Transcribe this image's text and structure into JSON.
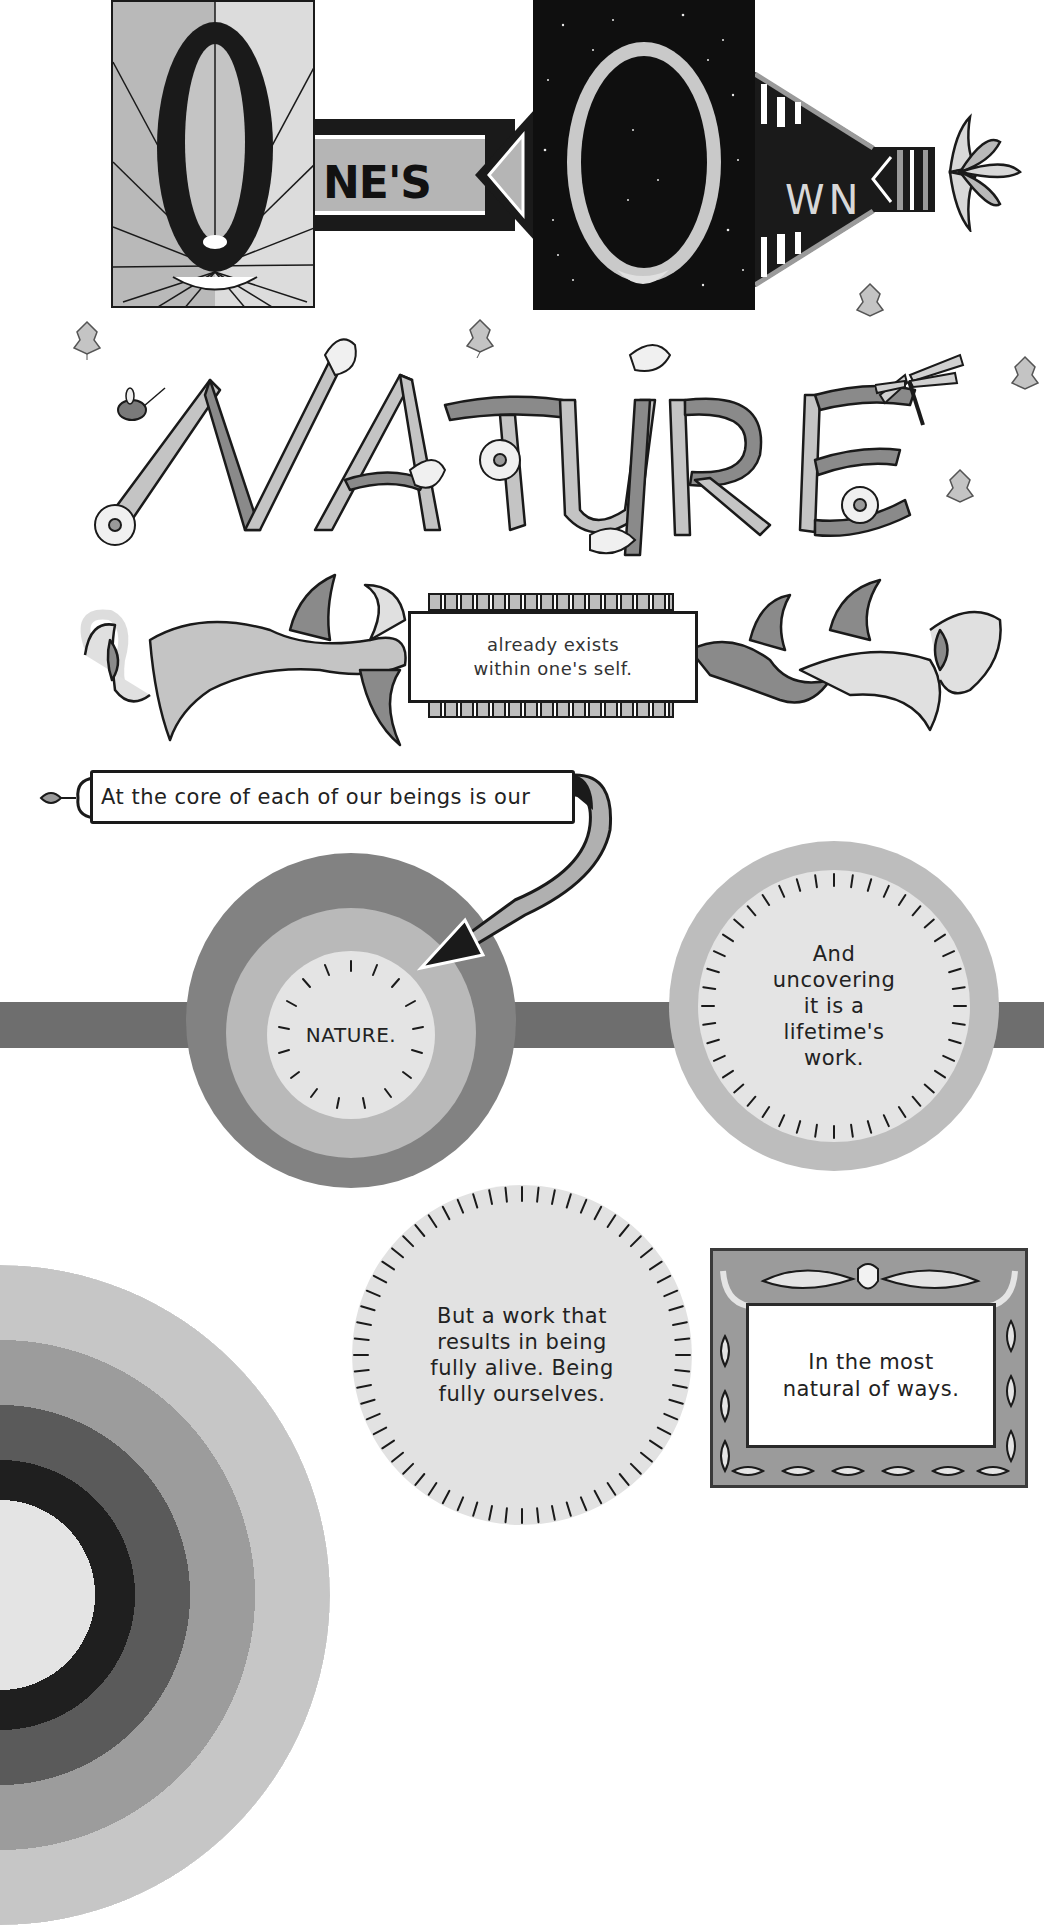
{
  "title_banner": {
    "letter_o_1": "O",
    "ribbon_1_text": "NE'S",
    "letter_o_2": "O",
    "ribbon_2_text": "WN",
    "full_phrase": "One's Own"
  },
  "headline": {
    "text": "NATURE",
    "letters": [
      "N",
      "A",
      "T",
      "U",
      "R",
      "E"
    ]
  },
  "vine_caption": {
    "line1": "already exists",
    "line2": "within one's self."
  },
  "scroll_caption": {
    "text": "At the core of each of our beings is our"
  },
  "circle_1": {
    "text": "NATURE."
  },
  "circle_2": {
    "text": "And\nuncovering\nit is a\nlifetime's\nwork."
  },
  "circle_3": {
    "text": "But a work that\nresults in being\nfully alive. Being\nfully ourselves."
  },
  "frame_caption": {
    "text": "In the most\nnatural of ways."
  },
  "decorations": {
    "icons": [
      "sun-rays-icon",
      "starry-sky-icon",
      "moon-icon",
      "lotus-flower-icon",
      "maple-leaf-icon",
      "ladybug-icon",
      "dragonfly-icon",
      "daisy-flower-icon",
      "acanthus-vine-icon",
      "arrow-icon",
      "acorn-icon",
      "oak-leaf-icon",
      "rainbow-arc-icon"
    ]
  },
  "colors": {
    "ink": "#1a1a1a",
    "gray_dark": "#6e6e6e",
    "gray_mid": "#828282",
    "gray_light": "#b9b9b9",
    "gray_pale": "#e4e4e4",
    "paper": "#ffffff"
  }
}
